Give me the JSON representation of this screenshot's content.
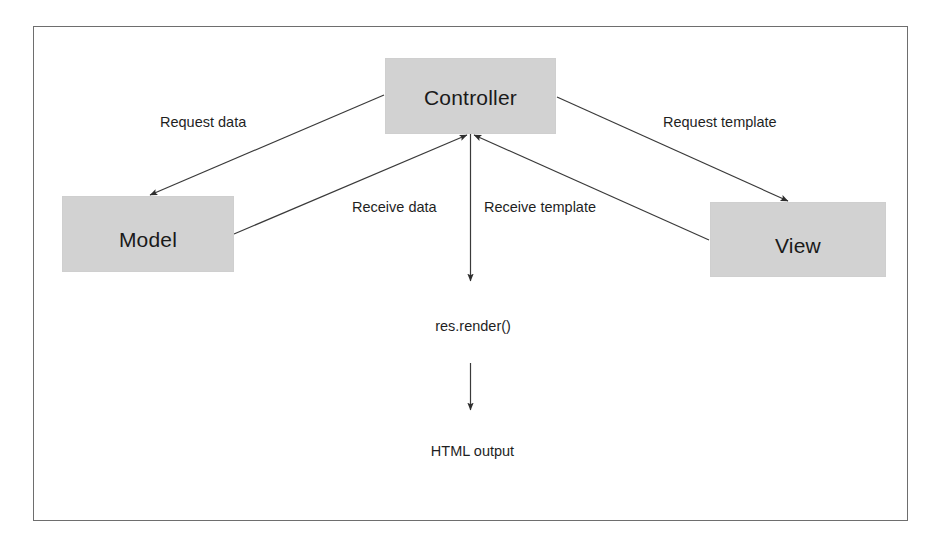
{
  "diagram": {
    "type": "flow-diagram",
    "frame": {
      "visible": true,
      "border_color": "#6e6e6e"
    },
    "colors": {
      "node_fill": "#d2d2d2",
      "node_border": "#cfcfcf",
      "line": "#3a3a3a",
      "text": "#1f1f1f",
      "background": "#ffffff"
    },
    "nodes": [
      {
        "id": "controller",
        "label": "Controller",
        "shape": "rectangle"
      },
      {
        "id": "model",
        "label": "Model",
        "shape": "rectangle"
      },
      {
        "id": "view",
        "label": "View",
        "shape": "rectangle"
      },
      {
        "id": "res_render",
        "label": "res.render()",
        "shape": "text"
      },
      {
        "id": "html_output",
        "label": "HTML output",
        "shape": "text"
      }
    ],
    "edges": [
      {
        "id": "controller-to-model",
        "from": "controller",
        "to": "model",
        "label": "Request data",
        "arrow": "to"
      },
      {
        "id": "controller-to-view",
        "from": "controller",
        "to": "view",
        "label": "Request template",
        "arrow": "to"
      },
      {
        "id": "model-to-controller",
        "from": "model",
        "to": "controller",
        "label": "Receive data",
        "arrow": "to"
      },
      {
        "id": "view-to-controller",
        "from": "view",
        "to": "controller",
        "label": "Receive template",
        "arrow": "to"
      },
      {
        "id": "controller-to-res-render",
        "from": "controller",
        "to": "res_render",
        "label": "",
        "arrow": "to"
      },
      {
        "id": "res-render-to-html-output",
        "from": "res_render",
        "to": "html_output",
        "label": "",
        "arrow": "to"
      }
    ],
    "labels": {
      "request_data": "Request data",
      "request_template": "Request template",
      "receive_data": "Receive data",
      "receive_template": "Receive template",
      "res_render": "res.render()",
      "html_output": "HTML output"
    }
  }
}
